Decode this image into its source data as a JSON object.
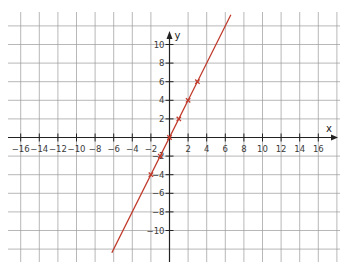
{
  "chart_data": {
    "type": "line",
    "title": "",
    "xlabel": "x",
    "ylabel": "y",
    "xlim": [
      -17,
      18
    ],
    "ylim": [
      -12.5,
      14
    ],
    "grid": true,
    "grid_step": 2,
    "x_ticks": [
      -16,
      -14,
      -12,
      -10,
      -8,
      -6,
      -4,
      -2,
      2,
      4,
      6,
      8,
      10,
      12,
      14,
      16
    ],
    "x_tick_labels": [
      "−16",
      "−14",
      "−12",
      "−10",
      "−8",
      "−6",
      "−4",
      "−2",
      "2",
      "4",
      "6",
      "8",
      "10",
      "12",
      "14",
      "16"
    ],
    "y_ticks": [
      10,
      8,
      6,
      4,
      2,
      -2,
      -4,
      -6,
      -8,
      -10
    ],
    "y_tick_labels": [
      "10",
      "8",
      "6",
      "4",
      "2",
      "−2",
      "−4",
      "−6",
      "−8",
      "−10"
    ],
    "series": [
      {
        "name": "y = 2x",
        "color": "#c0392b",
        "line_from": {
          "x": -6.2,
          "y": -12.4
        },
        "line_to": {
          "x": 6.6,
          "y": 13.2
        },
        "marked_points": [
          {
            "x": -2,
            "y": -4
          },
          {
            "x": -1,
            "y": -2
          },
          {
            "x": 0,
            "y": 0
          },
          {
            "x": 1,
            "y": 2
          },
          {
            "x": 2,
            "y": 4
          },
          {
            "x": 3,
            "y": 6
          }
        ]
      }
    ]
  },
  "labels": {
    "x_axis": "x",
    "y_axis": "y"
  },
  "colors": {
    "grid": "#9a9a9a",
    "axis": "#222222",
    "line": "#c0392b"
  }
}
